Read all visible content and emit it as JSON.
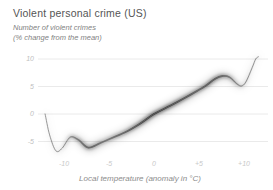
{
  "header": {
    "title": "Violent personal crime (US)",
    "subtitle_line1": "Number of violent crimes",
    "subtitle_line2": "(% change from the mean)"
  },
  "chart_data": {
    "type": "line",
    "title": "Violent personal crime (US)",
    "ylabel": "Number of violent crimes (% change from the mean)",
    "xlabel": "Local temperature (anomaly in °C)",
    "xlim": [
      -13,
      12.7
    ],
    "ylim": [
      -7.5,
      11.6
    ],
    "grid": "horizontal-only",
    "legend": "none",
    "line_color": "#4a4a4a",
    "band_style": "blurred uncertainty band, darkest in mid-range, thin crisp line at both extremes",
    "yticks": [
      {
        "v": 10,
        "label": "10"
      },
      {
        "v": 5,
        "label": "5"
      },
      {
        "v": 0,
        "label": "0"
      },
      {
        "v": -5,
        "label": "-5"
      }
    ],
    "xticks": [
      {
        "v": -10,
        "label": "-10"
      },
      {
        "v": -5,
        "label": "-5"
      },
      {
        "v": 0,
        "label": "0"
      },
      {
        "v": 5,
        "label": "+5"
      },
      {
        "v": 10,
        "label": "+10"
      }
    ],
    "points": [
      [
        -12.1,
        0.0
      ],
      [
        -11.6,
        -3.8
      ],
      [
        -10.9,
        -6.7
      ],
      [
        -10.2,
        -6.2
      ],
      [
        -9.3,
        -4.2
      ],
      [
        -8.4,
        -4.7
      ],
      [
        -7.3,
        -6.1
      ],
      [
        -6.0,
        -5.3
      ],
      [
        -4.9,
        -4.5
      ],
      [
        -3.2,
        -3.3
      ],
      [
        -1.6,
        -1.8
      ],
      [
        0.0,
        0.0
      ],
      [
        1.8,
        1.5
      ],
      [
        3.4,
        2.9
      ],
      [
        4.8,
        4.2
      ],
      [
        5.7,
        5.1
      ],
      [
        6.8,
        6.4
      ],
      [
        7.6,
        6.9
      ],
      [
        8.4,
        6.7
      ],
      [
        9.2,
        5.5
      ],
      [
        9.7,
        5.1
      ],
      [
        10.2,
        5.8
      ],
      [
        10.9,
        8.4
      ],
      [
        11.3,
        10.0
      ],
      [
        11.6,
        10.4
      ]
    ]
  }
}
